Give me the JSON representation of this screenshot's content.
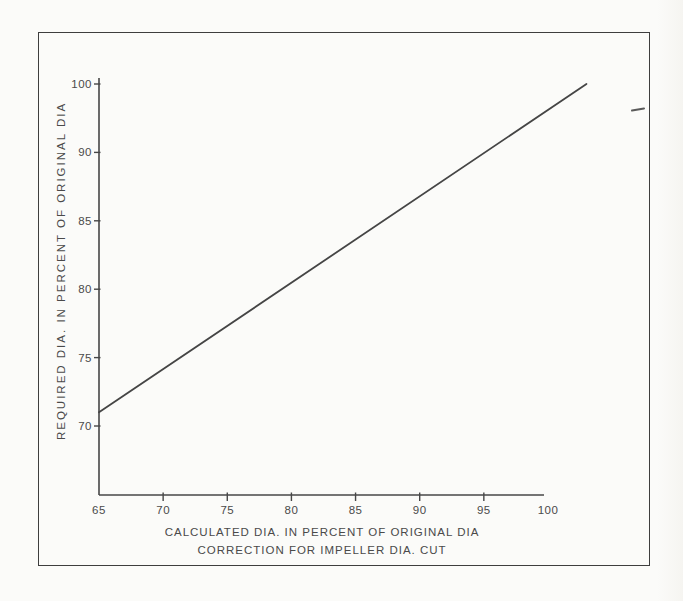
{
  "figure": {
    "background": "#fbfbf9",
    "frame_color": "#3e3e3e",
    "ink_color": "#474747",
    "text_color": "#4a4a4a"
  },
  "chart_data": {
    "type": "line",
    "title": "",
    "xlabel": "CALCULATED DIA. IN PERCENT OF ORIGINAL DIA",
    "xlabel_line2": "CORRECTION FOR IMPELLER DIA. CUT",
    "ylabel": "REQUIRED DIA. IN PERCENT OF ORIGINAL DIA",
    "x_ticks": [
      65,
      70,
      75,
      80,
      85,
      90,
      95,
      100
    ],
    "y_ticks_top_to_bottom": [
      100,
      90,
      85,
      80,
      75,
      70
    ],
    "xlim": [
      65,
      100
    ],
    "grid": false,
    "legend": false,
    "series": [
      {
        "name": "impeller-dia-correction-line",
        "color": "#454545",
        "shape": "straight",
        "points": [
          [
            65,
            71
          ],
          [
            103,
            100
          ]
        ]
      }
    ]
  },
  "artifacts": {
    "stray_dash_top_right": true
  }
}
